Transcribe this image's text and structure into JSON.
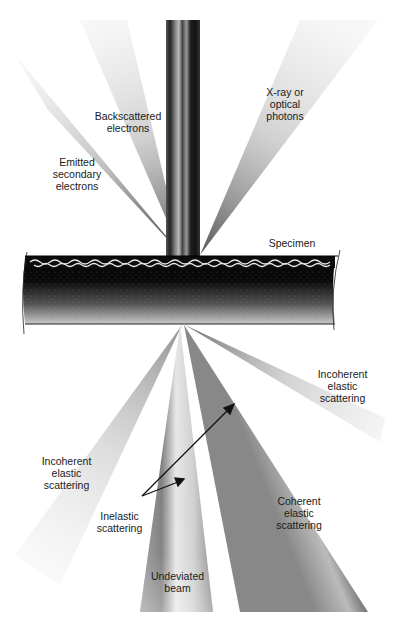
{
  "diagram": {
    "colors": {
      "background": "#ffffff",
      "beam_dark": "#111111",
      "fan_grey": "#8a8a8a",
      "text": "#1a1a1a"
    },
    "labels": {
      "backscattered": "Backscattered\nelectrons",
      "xray": "X-ray or\noptical\nphotons",
      "secondary": "Emitted\nsecondary\nelectrons",
      "specimen": "Specimen",
      "incoherent_right": "Incoherent\nelastic\nscattering",
      "incoherent_left": "Incoherent\nelastic\nscattering",
      "inelastic": "Inelastic\nscattering",
      "coherent": "Coherent\nelastic\nscattering",
      "undeviated": "Undeviated\nbeam"
    }
  }
}
